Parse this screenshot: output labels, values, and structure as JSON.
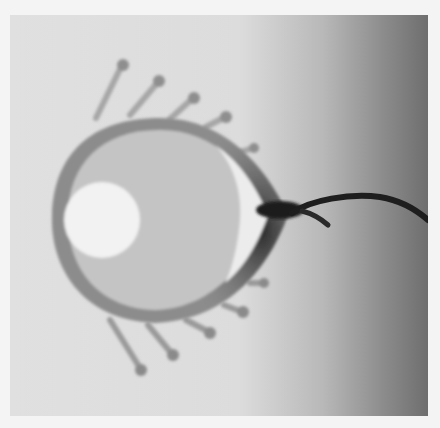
{
  "image": {
    "description": "Grayscale photograph of an eye-shaped object with eyelashes on a rim, a white circular pupil-like highlight, and a dark cord tied to the right corner extending to the right edge",
    "colors": {
      "background_light": "#e0e0e0",
      "background_dark": "#6e6e6e",
      "rim": "#8c8c8c",
      "iris": "#c4c4c4",
      "pupil_highlight": "#f0f0f0",
      "cord": "#1e1e1e"
    }
  }
}
